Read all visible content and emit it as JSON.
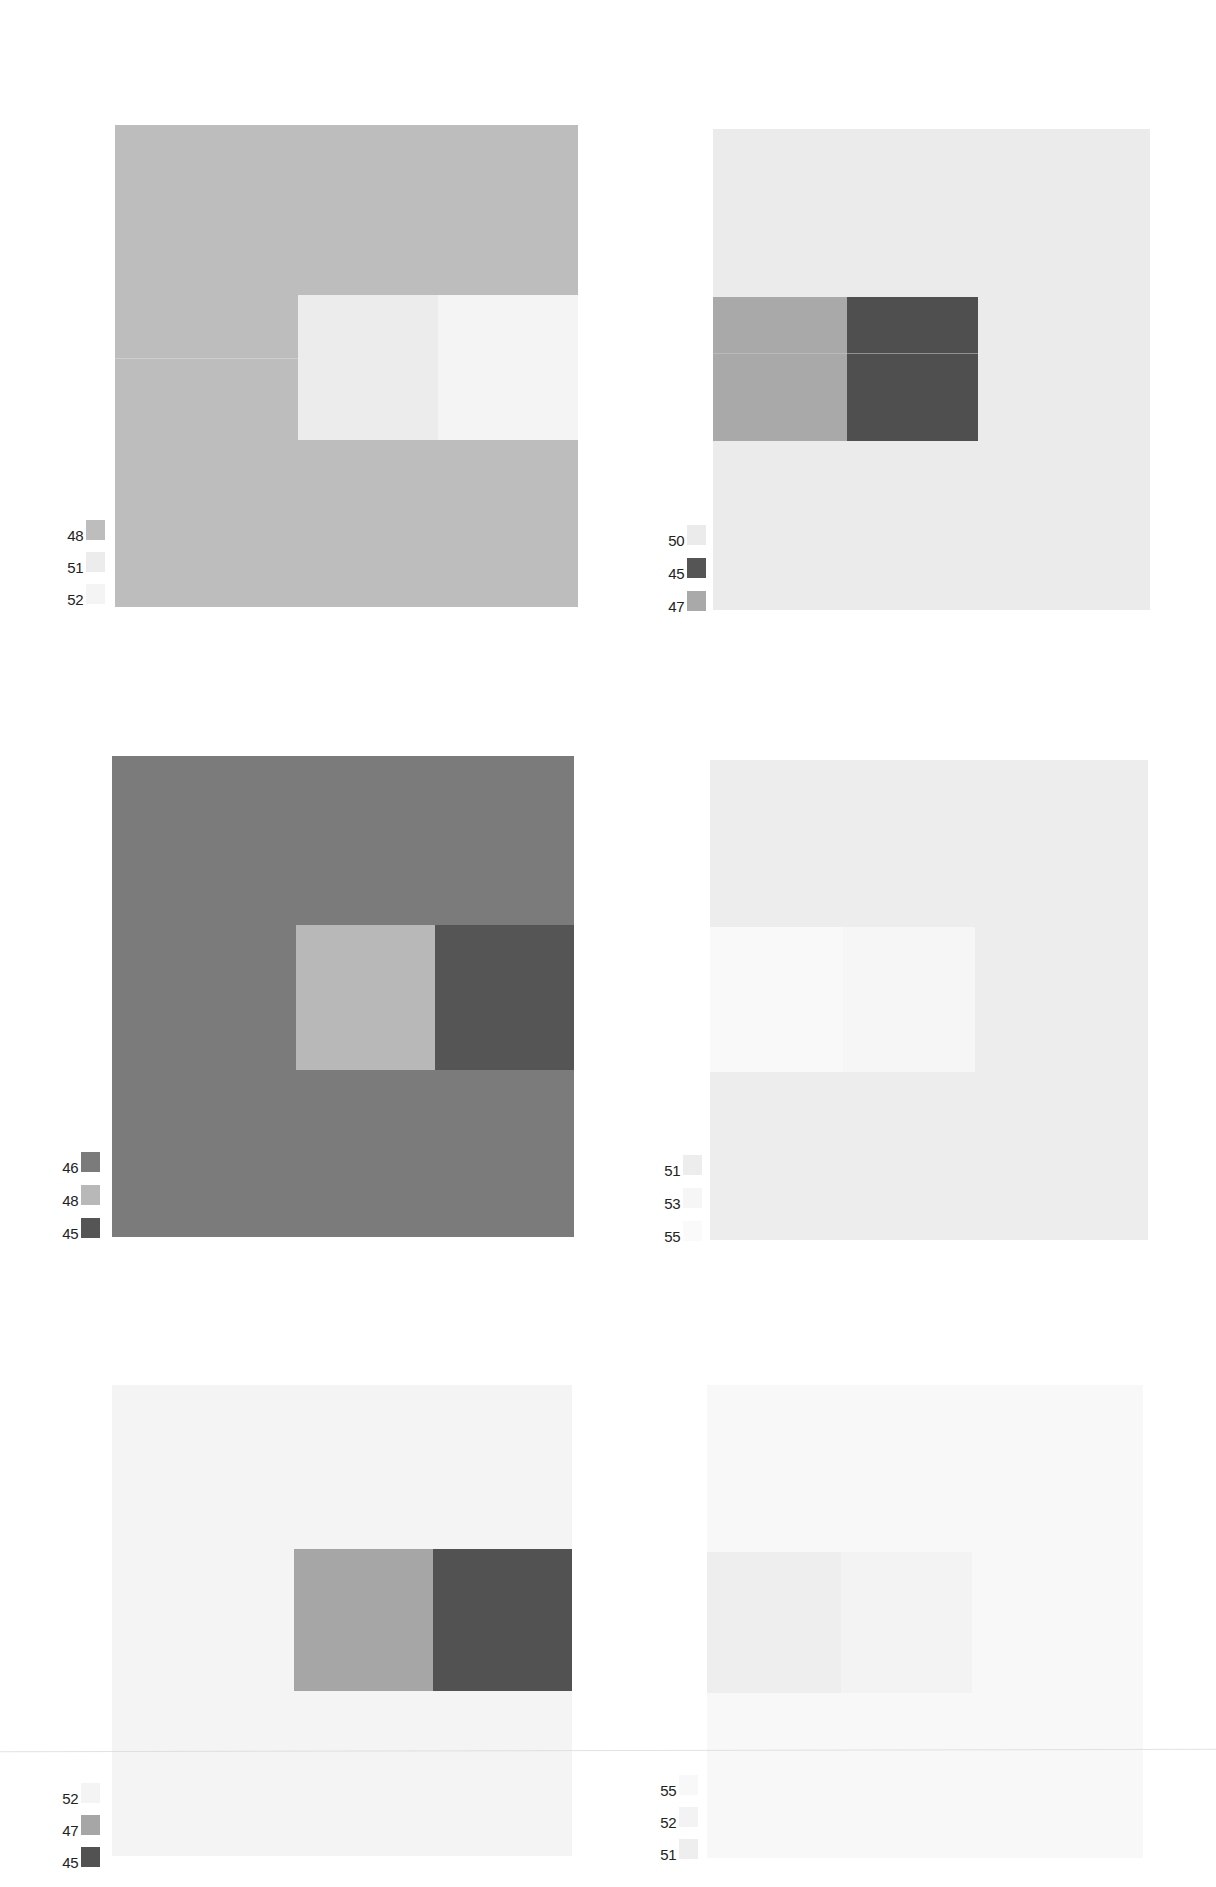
{
  "panels": [
    {
      "id": "p1",
      "box": {
        "x": 115,
        "y": 125,
        "w": 463,
        "h": 482
      },
      "ground": "#bdbdbd",
      "inner": {
        "x": 298,
        "y": 295,
        "w": 280,
        "h": 145,
        "split": 140
      },
      "left_color": "#ececec",
      "right_color": "#f4f4f4",
      "seam": {
        "y": 358,
        "x1": 115,
        "x2": 298,
        "color": "#dcdcdc"
      },
      "legend": {
        "x": 45,
        "y": 520,
        "gap": 32,
        "items": [
          {
            "label": "48",
            "color": "#bdbdbd"
          },
          {
            "label": "51",
            "color": "#ececec"
          },
          {
            "label": "52",
            "color": "#f4f4f4"
          }
        ]
      }
    },
    {
      "id": "p2",
      "box": {
        "x": 713,
        "y": 129,
        "w": 437,
        "h": 481
      },
      "ground": "#ebebeb",
      "inner": {
        "x": 713,
        "y": 297,
        "w": 265,
        "h": 144,
        "split": 134
      },
      "left_color": "#a9a9a9",
      "right_color": "#4f4f4f",
      "seam": {
        "y": 353,
        "x1": 713,
        "x2": 978,
        "color": "#c8c8c8"
      },
      "legend": {
        "x": 646,
        "y": 525,
        "gap": 33,
        "items": [
          {
            "label": "50",
            "color": "#ebebeb"
          },
          {
            "label": "45",
            "color": "#555555"
          },
          {
            "label": "47",
            "color": "#a9a9a9"
          }
        ]
      }
    },
    {
      "id": "p3",
      "box": {
        "x": 112,
        "y": 756,
        "w": 462,
        "h": 481
      },
      "ground": "#7b7b7b",
      "inner": {
        "x": 296,
        "y": 925,
        "w": 278,
        "h": 145,
        "split": 139
      },
      "left_color": "#b8b8b8",
      "right_color": "#555555",
      "legend": {
        "x": 40,
        "y": 1152,
        "gap": 33,
        "items": [
          {
            "label": "46",
            "color": "#7b7b7b"
          },
          {
            "label": "48",
            "color": "#b8b8b8"
          },
          {
            "label": "45",
            "color": "#555555"
          }
        ]
      }
    },
    {
      "id": "p4",
      "box": {
        "x": 710,
        "y": 760,
        "w": 438,
        "h": 480
      },
      "ground": "#ededed",
      "inner": {
        "x": 710,
        "y": 927,
        "w": 265,
        "h": 145,
        "split": 133
      },
      "left_color": "#f9f9f9",
      "right_color": "#f6f6f6",
      "legend": {
        "x": 642,
        "y": 1155,
        "gap": 33,
        "items": [
          {
            "label": "51",
            "color": "#ededed"
          },
          {
            "label": "53",
            "color": "#f6f6f6"
          },
          {
            "label": "55",
            "color": "#fafafa"
          }
        ]
      }
    },
    {
      "id": "p5",
      "box": {
        "x": 112,
        "y": 1385,
        "w": 460,
        "h": 471
      },
      "ground": "#f4f4f4",
      "inner": {
        "x": 294,
        "y": 1549,
        "w": 278,
        "h": 142,
        "split": 139
      },
      "left_color": "#a6a6a6",
      "right_color": "#525252",
      "legend": {
        "x": 40,
        "y": 1783,
        "gap": 32,
        "items": [
          {
            "label": "52",
            "color": "#f4f4f4"
          },
          {
            "label": "47",
            "color": "#a6a6a6"
          },
          {
            "label": "45",
            "color": "#525252"
          }
        ]
      }
    },
    {
      "id": "p6",
      "box": {
        "x": 707,
        "y": 1385,
        "w": 436,
        "h": 473
      },
      "ground": "#f8f8f8",
      "inner": {
        "x": 707,
        "y": 1552,
        "w": 265,
        "h": 141,
        "split": 134
      },
      "left_color": "#eeeeee",
      "right_color": "#f3f3f3",
      "legend": {
        "x": 638,
        "y": 1775,
        "gap": 32,
        "items": [
          {
            "label": "55",
            "color": "#f8f8f8"
          },
          {
            "label": "52",
            "color": "#f3f3f3"
          },
          {
            "label": "51",
            "color": "#eeeeee"
          }
        ]
      }
    }
  ]
}
